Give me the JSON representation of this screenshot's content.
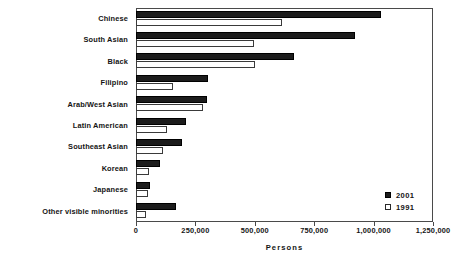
{
  "chart_data": {
    "type": "bar",
    "orientation": "horizontal",
    "title": "",
    "xlabel": "Persons",
    "ylabel": "",
    "xlim": [
      0,
      1250000
    ],
    "xticks": [
      0,
      250000,
      500000,
      750000,
      1000000,
      1250000
    ],
    "xticklabels": [
      "0",
      "250,000",
      "500,000",
      "750,000",
      "1,000,000",
      "1,250,000"
    ],
    "grid": false,
    "legend_position": "lower right",
    "categories": [
      "Chinese",
      "South Asian",
      "Black",
      "Filipino",
      "Arab/West Asian",
      "Latin American",
      "Southeast Asian",
      "Korean",
      "Japanese",
      "Other visible minorities"
    ],
    "series": [
      {
        "name": "2001",
        "color": "#1c1c1c",
        "values": [
          1030000,
          920000,
          665000,
          305000,
          300000,
          210000,
          195000,
          100000,
          60000,
          170000
        ]
      },
      {
        "name": "1991",
        "color": "#ffffff",
        "values": [
          615000,
          495000,
          500000,
          155000,
          280000,
          130000,
          115000,
          55000,
          50000,
          40000
        ]
      }
    ]
  }
}
